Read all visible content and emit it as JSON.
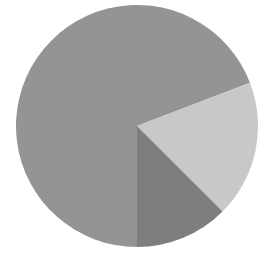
{
  "chart_data": {
    "type": "pie",
    "title": "",
    "subtitle": "",
    "xlabel": "",
    "ylabel": "",
    "grid": false,
    "legend": "none",
    "labels_shown": false,
    "tick_labels": [],
    "annotations": [],
    "start_angle_deg": 21,
    "direction": "counterclockwise",
    "center": {
      "x": 137,
      "y": 126
    },
    "radius": 121,
    "categories": [
      "Slice 1",
      "Slice 2",
      "Slice 3"
    ],
    "values": [
      68.5,
      18.3,
      13.2
    ],
    "colors": [
      "#949494",
      "#c8c8c8",
      "#7e7e7e"
    ],
    "slices": [
      {
        "name": "Slice 1",
        "value": 68.5,
        "percent": "68.5%",
        "color": "#949494",
        "start_angle_deg": 21,
        "end_angle_deg": 270
      },
      {
        "name": "Slice 2",
        "value": 18.3,
        "percent": "18.3%",
        "color": "#c8c8c8",
        "start_angle_deg": -45,
        "end_angle_deg": 21
      },
      {
        "name": "Slice 3",
        "value": 13.2,
        "percent": "13.2%",
        "color": "#7e7e7e",
        "start_angle_deg": -90,
        "end_angle_deg": -45
      }
    ],
    "background_color": "#ffffff"
  },
  "figure": {
    "width": 272,
    "height": 254,
    "background": "#ffffff"
  }
}
